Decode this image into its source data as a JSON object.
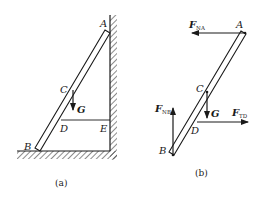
{
  "panel_a": {
    "caption": "(a)",
    "points": {
      "A": "A",
      "B": "B",
      "C": "C",
      "D": "D",
      "E": "E"
    },
    "force": {
      "G": "G"
    }
  },
  "panel_b": {
    "caption": "(b)",
    "points": {
      "A": "A",
      "B": "B",
      "C": "C",
      "D": "D"
    },
    "forces": {
      "F_NA": {
        "main": "F",
        "sub": "NA"
      },
      "F_NB": {
        "main": "F",
        "sub": "NB"
      },
      "F_TD": {
        "main": "F",
        "sub": "TD"
      },
      "G": "G"
    }
  },
  "colors": {
    "line": "#1a1a1a",
    "background": "#ffffff"
  }
}
